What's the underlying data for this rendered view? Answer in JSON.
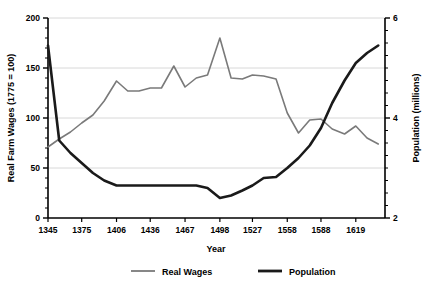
{
  "chart_data": {
    "type": "line",
    "title": "",
    "xlabel": "Year",
    "ylabel": "Real Farm Wages (1775 = 100)",
    "y2label": "Population (millions)",
    "xlim": [
      1345,
      1645
    ],
    "ylim": [
      0,
      200
    ],
    "y2lim": [
      2,
      6
    ],
    "grid": true,
    "legend_position": "bottom",
    "x_tick_labels": [
      "1345",
      "1375",
      "1406",
      "1436",
      "1467",
      "1498",
      "1527",
      "1558",
      "1588",
      "1619"
    ],
    "x_tick_values": [
      1345,
      1375,
      1406,
      1436,
      1467,
      1498,
      1527,
      1558,
      1588,
      1619
    ],
    "y_tick_labels": [
      "0",
      "50",
      "100",
      "150",
      "200"
    ],
    "y_tick_values": [
      0,
      50,
      100,
      150,
      200
    ],
    "y2_tick_labels": [
      "2",
      "4",
      "6"
    ],
    "y2_tick_values": [
      2,
      4,
      6
    ],
    "series": [
      {
        "name": "Real Wages",
        "color": "#7a7a7a",
        "axis": "left",
        "units": "index (1775 = 100)",
        "x": [
          1345,
          1355,
          1365,
          1375,
          1385,
          1395,
          1406,
          1416,
          1426,
          1436,
          1446,
          1457,
          1467,
          1477,
          1487,
          1498,
          1508,
          1518,
          1527,
          1537,
          1548,
          1558,
          1568,
          1578,
          1588,
          1598,
          1609,
          1619,
          1629,
          1639
        ],
        "values": [
          71,
          79,
          86,
          95,
          103,
          117,
          137,
          127,
          127,
          130,
          130,
          152,
          131,
          140,
          143,
          180,
          140,
          139,
          143,
          142,
          139,
          105,
          85,
          98,
          99,
          89,
          84,
          92,
          80,
          74
        ]
      },
      {
        "name": "Population",
        "color": "#1a1a1a",
        "axis": "right",
        "units": "millions",
        "x": [
          1345,
          1355,
          1365,
          1375,
          1385,
          1395,
          1406,
          1416,
          1426,
          1436,
          1446,
          1457,
          1467,
          1477,
          1487,
          1498,
          1508,
          1518,
          1527,
          1537,
          1548,
          1558,
          1568,
          1578,
          1588,
          1598,
          1609,
          1619,
          1629,
          1639
        ],
        "values": [
          5.45,
          3.55,
          3.3,
          3.1,
          2.9,
          2.75,
          2.65,
          2.65,
          2.65,
          2.65,
          2.65,
          2.65,
          2.65,
          2.65,
          2.6,
          2.4,
          2.45,
          2.55,
          2.65,
          2.8,
          2.82,
          3.0,
          3.2,
          3.45,
          3.8,
          4.3,
          4.75,
          5.1,
          5.3,
          5.45
        ]
      }
    ],
    "legend": [
      {
        "label": "Real Wages",
        "color": "#7a7a7a"
      },
      {
        "label": "Population",
        "color": "#1a1a1a"
      }
    ]
  }
}
